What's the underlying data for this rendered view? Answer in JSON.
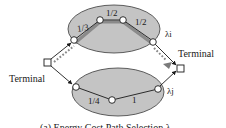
{
  "diagram": {
    "left_terminal_label": "Terminal",
    "right_terminal_label": "Terminal",
    "top_cluster": {
      "label": "λi",
      "edge_weights": [
        "1/3",
        "1/2",
        "1/2"
      ]
    },
    "bottom_cluster": {
      "label": "λj",
      "edge_weights": [
        "1/4",
        "1"
      ]
    },
    "caption": "(a) Energy Cost Path Selection λ"
  },
  "colors": {
    "cluster_fill": "#c4c4c4",
    "cluster_stroke": "#3a3a3a",
    "highlight_path": "#8a8a8a",
    "highlight_arrow": "#7a7a7a",
    "edge": "#1a1a1a",
    "node_fill": "#ffffff"
  }
}
